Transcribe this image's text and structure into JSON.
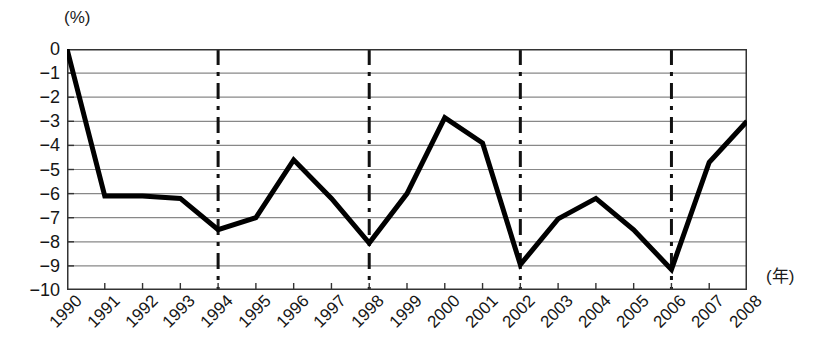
{
  "chart_data": {
    "type": "line",
    "title": "",
    "xlabel": "(年)",
    "ylabel": "(%)",
    "categories": [
      "1990",
      "1991",
      "1992",
      "1993",
      "1994",
      "1995",
      "1996",
      "1997",
      "1998",
      "1999",
      "2000",
      "2001",
      "2002",
      "2003",
      "2004",
      "2005",
      "2006",
      "2007",
      "2008"
    ],
    "values": [
      0,
      -6.1,
      -6.1,
      -6.2,
      -7.5,
      -7.0,
      -4.6,
      -6.2,
      -8.05,
      -6.0,
      -2.85,
      -3.9,
      -8.95,
      -7.05,
      -6.2,
      -7.5,
      -9.15,
      -4.7,
      -3.0
    ],
    "series": [
      {
        "name": "",
        "values": [
          0,
          -6.1,
          -6.1,
          -6.2,
          -7.5,
          -7.0,
          -4.6,
          -6.2,
          -8.05,
          -6.0,
          -2.85,
          -3.9,
          -8.95,
          -7.05,
          -6.2,
          -7.5,
          -9.15,
          -4.7,
          -3.0
        ]
      }
    ],
    "ylim": [
      -10,
      0
    ],
    "y_ticks": [
      0,
      -1,
      -2,
      -3,
      -4,
      -5,
      -6,
      -7,
      -8,
      -9,
      -10
    ],
    "y_tick_labels": [
      "0",
      "−1",
      "−2",
      "−3",
      "−4",
      "−5",
      "−6",
      "−7",
      "−8",
      "−9",
      "−10"
    ],
    "grid": true,
    "grid_axis": "y",
    "legend": "none",
    "marker_lines": {
      "style": "dash-dot-vertical",
      "at_categories": [
        "1994",
        "1998",
        "2002",
        "2006"
      ]
    },
    "line_color": "#000000",
    "grid_color": "#888888",
    "frame_color": "#333333"
  }
}
